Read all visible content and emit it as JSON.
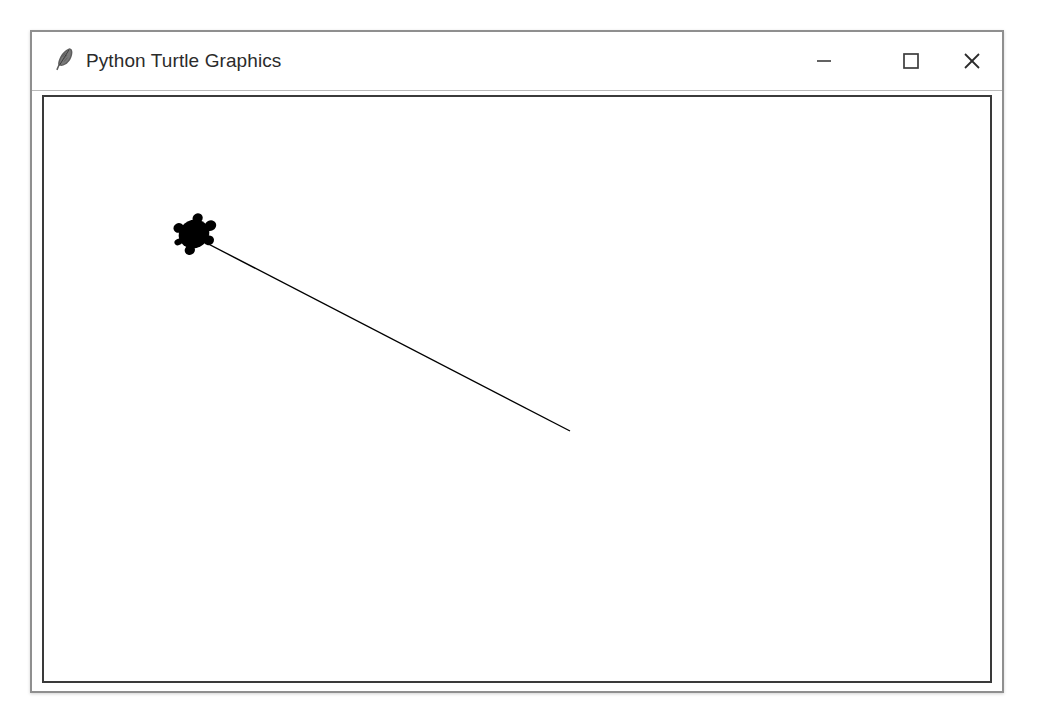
{
  "window": {
    "title": "Python Turtle Graphics",
    "icon": "feather-icon",
    "frame_color": "#8f8f8f",
    "titlebar_background": "#ffffff",
    "title_color": "#2b2b2b"
  },
  "window_controls": {
    "minimize": {
      "label": "Minimize",
      "icon": "minimize-icon",
      "glyph": "—"
    },
    "maximize": {
      "label": "Maximize",
      "icon": "maximize-icon",
      "glyph": "☐"
    },
    "close": {
      "label": "Close",
      "icon": "close-icon",
      "glyph": "✕"
    }
  },
  "canvas": {
    "background": "#ffffff",
    "border_color": "#3a3a3a",
    "width": 946,
    "height": 584,
    "pen_color": "#000000",
    "pen_size": 1,
    "turtle_shape": "turtle",
    "turtle_color": "#000000"
  },
  "drawing": {
    "turtle": {
      "x": 150,
      "y": 137,
      "heading_degrees": -27,
      "body_width": 40,
      "body_height": 32
    },
    "line": {
      "start_x": 147,
      "start_y": 138,
      "end_x": 526,
      "end_y": 334,
      "color": "#000000",
      "width": 1
    }
  },
  "accessibility": {
    "canvas_description": "Turtle graphics canvas with a single diagonal line drawn from upper left to lower right and a black turtle cursor at the line start."
  }
}
